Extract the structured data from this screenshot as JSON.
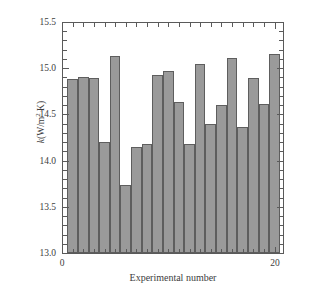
{
  "chart_data": {
    "type": "bar",
    "title": "",
    "xlabel": "Experimental number",
    "ylabel": "k (W/m² K)",
    "ylabel_symbol": "k",
    "ylabel_units": "(W/m",
    "ylabel_exponent": "2",
    "ylabel_units_tail": " K)",
    "categories": [
      1,
      2,
      3,
      4,
      5,
      6,
      7,
      8,
      9,
      10,
      11,
      12,
      13,
      14,
      15,
      16,
      17,
      18,
      19,
      20
    ],
    "values": [
      14.88,
      14.9,
      14.89,
      14.2,
      15.13,
      13.74,
      14.15,
      14.18,
      14.93,
      14.97,
      14.63,
      14.18,
      15.05,
      14.4,
      14.6,
      15.11,
      14.36,
      14.89,
      14.61,
      15.15
    ],
    "ylim": [
      13.0,
      15.5
    ],
    "xlim": [
      0,
      20.8
    ],
    "ytick_labels": [
      "13.0",
      "13.5",
      "14.0",
      "14.5",
      "15.0",
      "15.5"
    ],
    "ytick_values": [
      13.0,
      13.5,
      14.0,
      14.5,
      15.0,
      15.5
    ],
    "yminor_step": 0.1,
    "xtick_labels": [
      "0",
      "20"
    ],
    "xtick_values": [
      0,
      20
    ],
    "xminor_step": 1,
    "grid": false,
    "legend": null,
    "bar_color": "#9a9a9a",
    "bar_edge_color": "#5e5e5e",
    "axis_color": "#5a5a5a",
    "background": "#ffffff"
  }
}
